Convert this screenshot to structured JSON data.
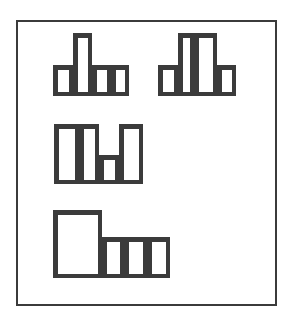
{
  "figure": {
    "canvas": {
      "width": 295,
      "height": 323,
      "background": "#ffffff"
    },
    "frame": {
      "name": "outer-frame",
      "x": 16,
      "y": 20,
      "width": 261,
      "height": 286,
      "stroke": "#3b3b3b",
      "stroke_width": 2,
      "fill": "none"
    },
    "style": {
      "stroke": "#3b3b3b",
      "stroke_width": 4.5,
      "fill": "#ffffff",
      "line_join": "miter"
    },
    "shapes": [
      {
        "name": "shape-top-left",
        "label": "T-shaped block group",
        "cell_count": 4,
        "bounds": {
          "x": 53,
          "y": 33,
          "width": 76,
          "height": 63
        },
        "cells": [
          {
            "name": "cell-tall-stem",
            "x": 73,
            "y": 33,
            "width": 19,
            "height": 63
          },
          {
            "name": "cell-left-base",
            "x": 53,
            "y": 65,
            "width": 20,
            "height": 31
          },
          {
            "name": "cell-mid-base",
            "x": 92,
            "y": 65,
            "width": 19,
            "height": 31
          },
          {
            "name": "cell-right-base",
            "x": 111,
            "y": 65,
            "width": 18,
            "height": 31
          }
        ]
      },
      {
        "name": "shape-top-right",
        "label": "Plateau block group",
        "cell_count": 4,
        "bounds": {
          "x": 158,
          "y": 33,
          "width": 78,
          "height": 63
        },
        "cells": [
          {
            "name": "cell-left-low",
            "x": 158,
            "y": 65,
            "width": 20,
            "height": 31
          },
          {
            "name": "cell-tall-left",
            "x": 178,
            "y": 33,
            "width": 16,
            "height": 63
          },
          {
            "name": "cell-tall-right",
            "x": 194,
            "y": 33,
            "width": 23,
            "height": 63
          },
          {
            "name": "cell-right-low",
            "x": 217,
            "y": 65,
            "width": 19,
            "height": 31
          }
        ]
      },
      {
        "name": "shape-middle-left",
        "label": "U-shaped block group",
        "cell_count": 4,
        "bounds": {
          "x": 54,
          "y": 124,
          "width": 89,
          "height": 60
        },
        "cells": [
          {
            "name": "cell-tall-left",
            "x": 54,
            "y": 124,
            "width": 25,
            "height": 60
          },
          {
            "name": "cell-tall-inner-left",
            "x": 79,
            "y": 124,
            "width": 20,
            "height": 60
          },
          {
            "name": "cell-short-middle",
            "x": 99,
            "y": 155,
            "width": 20,
            "height": 29
          },
          {
            "name": "cell-tall-right",
            "x": 119,
            "y": 124,
            "width": 24,
            "height": 60
          }
        ]
      },
      {
        "name": "shape-bottom-left",
        "label": "L-shaped block group",
        "cell_count": 4,
        "bounds": {
          "x": 53,
          "y": 210,
          "width": 117,
          "height": 68
        },
        "cells": [
          {
            "name": "cell-big-left",
            "x": 53,
            "y": 210,
            "width": 49,
            "height": 68
          },
          {
            "name": "cell-small-1",
            "x": 102,
            "y": 237,
            "width": 22,
            "height": 41
          },
          {
            "name": "cell-small-2",
            "x": 124,
            "y": 237,
            "width": 23,
            "height": 41
          },
          {
            "name": "cell-small-3",
            "x": 147,
            "y": 237,
            "width": 23,
            "height": 41
          }
        ]
      }
    ]
  }
}
